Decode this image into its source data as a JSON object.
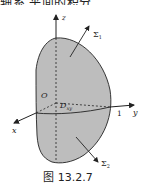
{
  "header_fragment": "轴系 平面的积分",
  "figure": {
    "caption": "图 13.2.7",
    "axes": {
      "x": "x",
      "y": "y",
      "z": "z",
      "origin": "O",
      "y_tick": "1"
    },
    "region_label": "D",
    "region_subscript": "xy",
    "surfaces": [
      {
        "name": "Σ",
        "subscript": "1",
        "position": "upper"
      },
      {
        "name": "Σ",
        "subscript": "2",
        "position": "lower"
      }
    ],
    "colors": {
      "surface_fill": "#bdbdbd",
      "stroke": "#222222"
    }
  }
}
